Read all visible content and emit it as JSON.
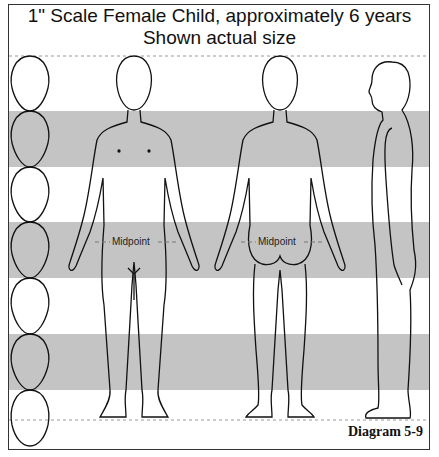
{
  "title": {
    "line1": "1\" Scale Female Child, approximately 6 years",
    "line2": "Shown actual size"
  },
  "labels": {
    "front_midpoint": "--Midpoint --",
    "back_midpoint": "--Midpoint --"
  },
  "caption": "Diagram 5-9",
  "scale": {
    "head_count": 7,
    "band_color": "#c4c4c4",
    "views": [
      "front",
      "back",
      "side"
    ]
  }
}
